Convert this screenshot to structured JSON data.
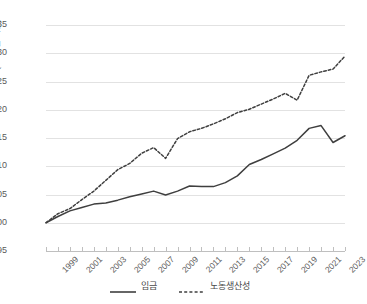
{
  "chart_data": {
    "type": "line",
    "title": "",
    "xlabel": "",
    "ylabel": "지표(1999년 기준)",
    "ylim": [
      95,
      135
    ],
    "ytick_labels": [
      "135",
      "130",
      "125",
      "120",
      "115",
      "110",
      "105",
      "100",
      "95"
    ],
    "ytick_values": [
      135,
      130,
      125,
      120,
      115,
      110,
      105,
      100,
      95
    ],
    "grid": true,
    "legend_position": "bottom",
    "x": [
      1999,
      2000,
      2001,
      2002,
      2003,
      2004,
      2005,
      2006,
      2007,
      2008,
      2009,
      2010,
      2011,
      2012,
      2013,
      2014,
      2015,
      2016,
      2017,
      2018,
      2019,
      2020,
      2021,
      2022,
      2023,
      2024
    ],
    "xtick_labels": [
      "1999",
      "2001",
      "2003",
      "2005",
      "2007",
      "2009",
      "2011",
      "2013",
      "2015",
      "2017",
      "2019",
      "2021",
      "2023"
    ],
    "xtick_values": [
      1999,
      2001,
      2003,
      2005,
      2007,
      2009,
      2011,
      2013,
      2015,
      2017,
      2019,
      2021,
      2023
    ],
    "xlim": [
      1999,
      2024
    ],
    "series": [
      {
        "name": "임금",
        "style": "solid",
        "color": "#3f3f3f",
        "values": [
          100.0,
          101.1,
          102.1,
          102.7,
          103.3,
          103.5,
          104.0,
          104.6,
          105.1,
          105.6,
          104.9,
          105.6,
          106.5,
          106.4,
          106.4,
          107.1,
          108.3,
          110.3,
          111.2,
          112.2,
          113.2,
          114.6,
          116.7,
          117.2,
          114.2,
          115.4
        ]
      },
      {
        "name": "노동생산성",
        "style": "dashed",
        "color": "#3f3f3f",
        "values": [
          100.0,
          101.6,
          102.5,
          104.1,
          105.6,
          107.5,
          109.4,
          110.5,
          112.3,
          113.3,
          111.4,
          114.9,
          116.1,
          116.7,
          117.5,
          118.4,
          119.5,
          120.1,
          121.0,
          121.9,
          122.9,
          121.7,
          126.1,
          126.7,
          127.2,
          129.5
        ]
      }
    ]
  },
  "legend": {
    "items": [
      {
        "label": "임금",
        "style": "solid"
      },
      {
        "label": "노동생산성",
        "style": "dashed"
      }
    ]
  }
}
